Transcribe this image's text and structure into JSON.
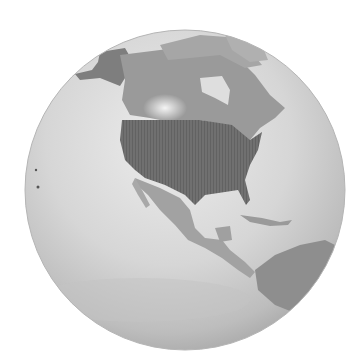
{
  "image": {
    "subject": "Grayscale globe showing North America with the United States highlighted",
    "colors": {
      "background": "#ffffff",
      "ocean_light": "#e2e2e2",
      "ocean_mid": "#cfcfcf",
      "ocean_shadow": "#a8a8a8",
      "land": "#9a9a9a",
      "land_light": "#bdbdbd",
      "usa": "#6e6e6e",
      "ice": "#d8d8d8"
    }
  }
}
